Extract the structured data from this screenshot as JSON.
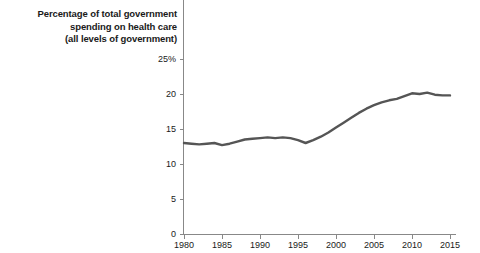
{
  "chart_data": {
    "type": "line",
    "title": "Percentage of total government spending on health care (all levels of government)",
    "title_lines": [
      "Percentage of total government",
      "spending on health care",
      "(all levels of government)"
    ],
    "xlabel": "",
    "ylabel": "",
    "xlim": [
      1980,
      2015
    ],
    "ylim": [
      0,
      25
    ],
    "grid": false,
    "legend": null,
    "line_color": "#555555",
    "axis_color": "#888888",
    "text_color": "#1a1a1a",
    "yticks": [
      0,
      5,
      10,
      15,
      20,
      25
    ],
    "ytick_labels": [
      "0",
      "5",
      "10",
      "15",
      "20",
      "25%"
    ],
    "xticks": [
      1980,
      1985,
      1990,
      1995,
      2000,
      2005,
      2010,
      2015
    ],
    "xtick_labels": [
      "1980",
      "1985",
      "1990",
      "1995",
      "2000",
      "2005",
      "2010",
      "2015"
    ],
    "series": [
      {
        "name": "Percentage of total government spending on health care",
        "x": [
          1980,
          1981,
          1982,
          1983,
          1984,
          1985,
          1986,
          1987,
          1988,
          1989,
          1990,
          1991,
          1992,
          1993,
          1994,
          1995,
          1996,
          1997,
          1998,
          1999,
          2000,
          2001,
          2002,
          2003,
          2004,
          2005,
          2006,
          2007,
          2008,
          2009,
          2010,
          2011,
          2012,
          2013,
          2014,
          2015
        ],
        "values": [
          13.0,
          12.9,
          12.8,
          12.9,
          13.0,
          12.7,
          12.9,
          13.2,
          13.5,
          13.6,
          13.7,
          13.8,
          13.7,
          13.8,
          13.7,
          13.4,
          13.0,
          13.4,
          13.9,
          14.5,
          15.2,
          15.9,
          16.6,
          17.3,
          17.9,
          18.4,
          18.8,
          19.1,
          19.3,
          19.7,
          20.1,
          20.0,
          20.2,
          19.9,
          19.8,
          19.8
        ]
      }
    ]
  }
}
